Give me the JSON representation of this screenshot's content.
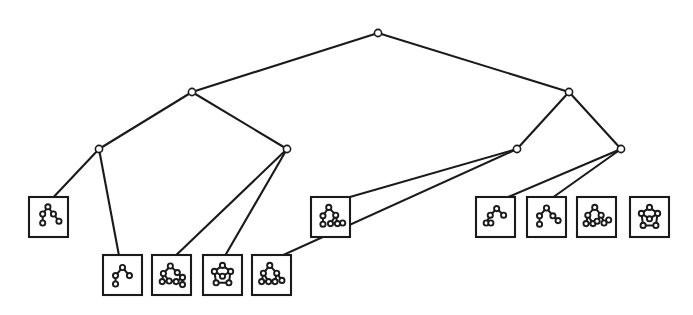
{
  "figure": {
    "background_color": "#ffffff",
    "stroke_color": "#1a1a1a",
    "node_fill_color": "#ffffff",
    "width": 693,
    "height": 315
  },
  "chart_data": {
    "type": "diagram",
    "subtype": "dendrogram-tree",
    "title": "",
    "xlabel": "",
    "ylabel": "",
    "orientation": "top-down",
    "levels": 4,
    "internal_node_count": 7,
    "leaf_count": 10,
    "internal_nodes": [
      {
        "id": "root",
        "label": "root",
        "level": 0,
        "x": 378,
        "y": 33,
        "radius": 3.6
      },
      {
        "id": "n-l",
        "label": "L",
        "level": 1,
        "x": 192,
        "y": 92,
        "radius": 3.6
      },
      {
        "id": "n-r",
        "label": "R",
        "level": 1,
        "x": 569,
        "y": 92,
        "radius": 3.6
      },
      {
        "id": "n-ll",
        "label": "LL",
        "level": 2,
        "x": 99,
        "y": 149,
        "radius": 3.6
      },
      {
        "id": "n-lr",
        "label": "LR",
        "level": 2,
        "x": 287,
        "y": 149,
        "radius": 3.6
      },
      {
        "id": "n-rl",
        "label": "RL",
        "level": 2,
        "x": 517,
        "y": 149,
        "radius": 3.6
      },
      {
        "id": "n-rr",
        "label": "RR",
        "level": 2,
        "x": 621,
        "y": 149,
        "radius": 3.6
      }
    ],
    "edges": [
      {
        "from": "root",
        "to": "n-l"
      },
      {
        "from": "root",
        "to": "n-r"
      },
      {
        "from": "n-l",
        "to": "n-ll"
      },
      {
        "from": "n-l",
        "to": "n-lr"
      },
      {
        "from": "n-r",
        "to": "n-rl"
      },
      {
        "from": "n-r",
        "to": "n-rr"
      },
      {
        "from": "n-ll",
        "to": "leaf-1"
      },
      {
        "from": "n-ll",
        "to": "leaf-2"
      },
      {
        "from": "n-lr",
        "to": "leaf-3"
      },
      {
        "from": "n-lr",
        "to": "leaf-4"
      },
      {
        "from": "n-rl",
        "to": "leaf-5"
      },
      {
        "from": "n-rl",
        "to": "leaf-6"
      },
      {
        "from": "n-rr",
        "to": "leaf-7"
      },
      {
        "from": "n-rr",
        "to": "leaf-8"
      }
    ],
    "leaves": [
      {
        "id": "leaf-1",
        "label": "graph-1",
        "parent": "n-ll",
        "box": {
          "x": 29,
          "y": 197,
          "w": 39,
          "h": 40
        },
        "anchor": {
          "x": 48,
          "y": 203
        },
        "graph": {
          "node_count": 5,
          "edge_count": 4,
          "shape": "tree",
          "nodes": [
            [
              0.48,
              0.16
            ],
            [
              0.3,
              0.4
            ],
            [
              0.67,
              0.4
            ],
            [
              0.3,
              0.7
            ],
            [
              0.86,
              0.64
            ]
          ],
          "links": [
            [
              0,
              1
            ],
            [
              0,
              2
            ],
            [
              1,
              3
            ],
            [
              2,
              4
            ]
          ]
        }
      },
      {
        "id": "leaf-2",
        "label": "graph-2",
        "parent": "n-ll",
        "box": {
          "x": 103,
          "y": 255,
          "w": 39,
          "h": 40
        },
        "anchor": {
          "x": 120,
          "y": 261
        },
        "graph": {
          "node_count": 4,
          "edge_count": 3,
          "shape": "star",
          "nodes": [
            [
              0.5,
              0.25
            ],
            [
              0.26,
              0.52
            ],
            [
              0.74,
              0.52
            ],
            [
              0.26,
              0.8
            ]
          ],
          "links": [
            [
              0,
              1
            ],
            [
              0,
              2
            ],
            [
              1,
              3
            ]
          ]
        }
      },
      {
        "id": "leaf-3",
        "label": "graph-3",
        "parent": "n-lr",
        "box": {
          "x": 152,
          "y": 255,
          "w": 39,
          "h": 40
        },
        "anchor": {
          "x": 170,
          "y": 261
        },
        "graph": {
          "node_count": 8,
          "edge_count": 9,
          "shape": "dense-cluster",
          "nodes": [
            [
              0.46,
              0.2
            ],
            [
              0.22,
              0.45
            ],
            [
              0.7,
              0.42
            ],
            [
              0.18,
              0.72
            ],
            [
              0.42,
              0.7
            ],
            [
              0.66,
              0.72
            ],
            [
              0.88,
              0.58
            ],
            [
              0.88,
              0.82
            ]
          ],
          "links": [
            [
              0,
              1
            ],
            [
              0,
              2
            ],
            [
              1,
              3
            ],
            [
              1,
              4
            ],
            [
              3,
              4
            ],
            [
              4,
              5
            ],
            [
              2,
              6
            ],
            [
              5,
              6
            ],
            [
              6,
              7
            ]
          ]
        }
      },
      {
        "id": "leaf-4",
        "label": "graph-4",
        "parent": "n-lr",
        "box": {
          "x": 203,
          "y": 255,
          "w": 39,
          "h": 40
        },
        "anchor": {
          "x": 222,
          "y": 261
        },
        "graph": {
          "node_count": 6,
          "edge_count": 6,
          "shape": "ring",
          "nodes": [
            [
              0.5,
              0.18
            ],
            [
              0.22,
              0.38
            ],
            [
              0.78,
              0.38
            ],
            [
              0.5,
              0.54
            ],
            [
              0.28,
              0.76
            ],
            [
              0.72,
              0.76
            ]
          ],
          "links": [
            [
              0,
              1
            ],
            [
              0,
              2
            ],
            [
              1,
              3
            ],
            [
              2,
              3
            ],
            [
              1,
              4
            ],
            [
              2,
              5
            ],
            [
              4,
              5
            ]
          ]
        }
      },
      {
        "id": "leaf-5",
        "label": "graph-5",
        "parent": "n-rl",
        "box": {
          "x": 252,
          "y": 255,
          "w": 39,
          "h": 40
        },
        "anchor": {
          "x": 270,
          "y": 261
        },
        "graph": {
          "node_count": 7,
          "edge_count": 7,
          "shape": "branched",
          "nodes": [
            [
              0.44,
              0.18
            ],
            [
              0.22,
              0.44
            ],
            [
              0.68,
              0.44
            ],
            [
              0.16,
              0.72
            ],
            [
              0.4,
              0.72
            ],
            [
              0.62,
              0.72
            ],
            [
              0.86,
              0.68
            ]
          ],
          "links": [
            [
              0,
              1
            ],
            [
              0,
              2
            ],
            [
              1,
              3
            ],
            [
              1,
              4
            ],
            [
              3,
              4
            ],
            [
              2,
              5
            ],
            [
              2,
              6
            ]
          ]
        }
      },
      {
        "id": "leaf-6",
        "label": "graph-6",
        "parent": "n-rl",
        "box": {
          "x": 311,
          "y": 197,
          "w": 39,
          "h": 40
        },
        "anchor": {
          "x": 329,
          "y": 203
        },
        "graph": {
          "node_count": 7,
          "edge_count": 6,
          "shape": "double-branch",
          "nodes": [
            [
              0.44,
              0.18
            ],
            [
              0.24,
              0.46
            ],
            [
              0.68,
              0.44
            ],
            [
              0.24,
              0.74
            ],
            [
              0.5,
              0.72
            ],
            [
              0.74,
              0.72
            ],
            [
              0.92,
              0.7
            ]
          ],
          "links": [
            [
              0,
              1
            ],
            [
              0,
              2
            ],
            [
              1,
              3
            ],
            [
              2,
              4
            ],
            [
              2,
              5
            ],
            [
              5,
              6
            ]
          ]
        }
      },
      {
        "id": "leaf-7",
        "label": "graph-7",
        "parent": "n-rr",
        "box": {
          "x": 476,
          "y": 197,
          "w": 39,
          "h": 40
        },
        "anchor": {
          "x": 494,
          "y": 203
        },
        "graph": {
          "node_count": 5,
          "edge_count": 4,
          "shape": "chain",
          "nodes": [
            [
              0.54,
              0.22
            ],
            [
              0.32,
              0.44
            ],
            [
              0.78,
              0.44
            ],
            [
              0.18,
              0.7
            ],
            [
              0.34,
              0.7
            ]
          ],
          "links": [
            [
              0,
              1
            ],
            [
              0,
              2
            ],
            [
              1,
              3
            ],
            [
              3,
              4
            ]
          ]
        }
      },
      {
        "id": "leaf-8",
        "label": "graph-8",
        "parent": "n-rr",
        "box": {
          "x": 527,
          "y": 197,
          "w": 39,
          "h": 40
        },
        "anchor": {
          "x": 545,
          "y": 203
        },
        "graph": {
          "node_count": 5,
          "edge_count": 4,
          "shape": "tree",
          "nodes": [
            [
              0.5,
              0.2
            ],
            [
              0.26,
              0.46
            ],
            [
              0.72,
              0.46
            ],
            [
              0.26,
              0.74
            ],
            [
              0.9,
              0.62
            ]
          ],
          "links": [
            [
              0,
              1
            ],
            [
              0,
              2
            ],
            [
              1,
              3
            ],
            [
              2,
              4
            ]
          ]
        }
      },
      {
        "id": "leaf-9",
        "label": "graph-9",
        "parent": "n-rr",
        "box": {
          "x": 577,
          "y": 197,
          "w": 39,
          "h": 40
        },
        "anchor": {
          "x": 595,
          "y": 203
        },
        "graph": {
          "node_count": 8,
          "edge_count": 8,
          "shape": "dense-branch",
          "nodes": [
            [
              0.44,
              0.18
            ],
            [
              0.2,
              0.44
            ],
            [
              0.66,
              0.44
            ],
            [
              0.14,
              0.72
            ],
            [
              0.38,
              0.72
            ],
            [
              0.52,
              0.64
            ],
            [
              0.76,
              0.7
            ],
            [
              0.92,
              0.6
            ]
          ],
          "links": [
            [
              0,
              1
            ],
            [
              0,
              2
            ],
            [
              1,
              3
            ],
            [
              1,
              4
            ],
            [
              3,
              4
            ],
            [
              2,
              5
            ],
            [
              2,
              6
            ],
            [
              6,
              7
            ]
          ]
        }
      },
      {
        "id": "leaf-10",
        "label": "graph-10",
        "parent": "n-rr",
        "box": {
          "x": 630,
          "y": 197,
          "w": 39,
          "h": 40
        },
        "anchor": {
          "x": 648,
          "y": 203
        },
        "graph": {
          "node_count": 6,
          "edge_count": 6,
          "shape": "ring",
          "nodes": [
            [
              0.5,
              0.18
            ],
            [
              0.22,
              0.38
            ],
            [
              0.78,
              0.38
            ],
            [
              0.5,
              0.56
            ],
            [
              0.28,
              0.78
            ],
            [
              0.72,
              0.78
            ]
          ],
          "links": [
            [
              0,
              1
            ],
            [
              0,
              2
            ],
            [
              1,
              3
            ],
            [
              2,
              3
            ],
            [
              1,
              4
            ],
            [
              2,
              5
            ],
            [
              4,
              5
            ]
          ]
        }
      }
    ]
  }
}
